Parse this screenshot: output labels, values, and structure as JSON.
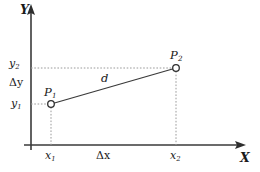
{
  "figure": {
    "type": "cartesian-distance-diagram",
    "colors": {
      "stroke": "#3a3a3a",
      "text": "#1a1a1a",
      "dotted": "#9a9a9a",
      "background": "#ffffff",
      "marker_fill": "#ffffff"
    },
    "axes": {
      "x_label": "X",
      "y_label": "Y",
      "origin_px": {
        "x": 31,
        "y": 145
      }
    },
    "tick_labels": {
      "y2": "y",
      "y2_sub": "2",
      "y1": "y",
      "y1_sub": "1",
      "x1": "x",
      "x1_sub": "1",
      "x2": "x",
      "x2_sub": "2"
    },
    "deltas": {
      "dy": "Δy",
      "dx": "Δx"
    },
    "points": [
      {
        "name": "P",
        "sub": "1",
        "px": {
          "x": 51,
          "y": 104
        }
      },
      {
        "name": "P",
        "sub": "2",
        "px": {
          "x": 176,
          "y": 68
        }
      }
    ],
    "segment": {
      "label": "d",
      "from": "P1",
      "to": "P2"
    }
  }
}
